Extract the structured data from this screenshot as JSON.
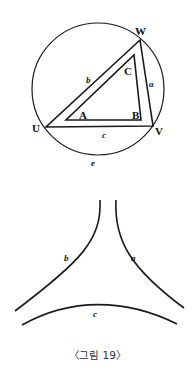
{
  "figure": {
    "caption": "〈그림 19〉",
    "top_diagram": {
      "description": "Circle with inscribed triangle UVW and inner triangle ABC",
      "vertex_labels": {
        "U": "U",
        "V": "V",
        "W": "W",
        "A": "A",
        "B": "B",
        "C": "C"
      },
      "side_labels": {
        "a": "a",
        "b": "b",
        "c": "c",
        "e": "e"
      }
    },
    "bottom_diagram": {
      "description": "Three concave curves forming a hyperbolic triangle",
      "curve_labels": {
        "a": "a",
        "b": "b",
        "c": "c"
      }
    },
    "colors": {
      "ink": "#1a1a1a",
      "background": "#ffffff"
    }
  }
}
